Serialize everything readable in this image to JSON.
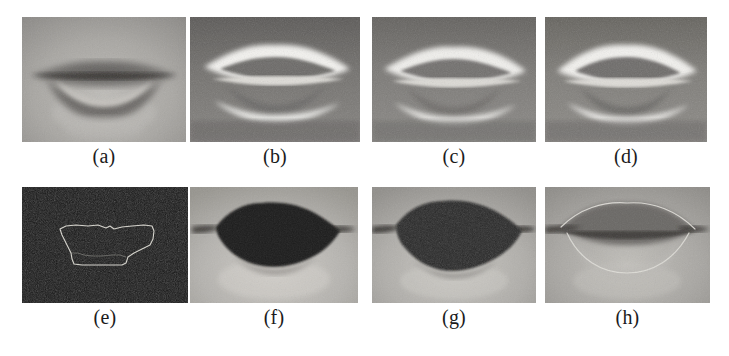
{
  "figure": {
    "layout": {
      "columns": 4,
      "rows": 2,
      "panel_width": 164,
      "panel_height": 125,
      "row1_top": 17,
      "row2_top": 187,
      "row2_panel_height": 116,
      "col_lefts": [
        22,
        190,
        372,
        545
      ],
      "label_row1_top": 145,
      "label_row2_top": 306
    },
    "background_color": "#ffffff",
    "label_color": "#1b1b1b",
    "panels": [
      {
        "id": "a",
        "label": "(a)",
        "caption_text": "(a)",
        "description": "original grayscale mouth image, closed lips, soft blurred contrast",
        "render": {
          "style": "photo",
          "skin_tone": "#a8a6a2",
          "lip_tone": "#5f5d5c",
          "inner_tone": "#cfcdc9",
          "noise": 0.1,
          "contrast": "low",
          "mouth_open": false,
          "edge_overlay": "none",
          "fill_mouth": false
        }
      },
      {
        "id": "b",
        "label": "(b)",
        "caption_text": "(b)",
        "description": "high-pass / gradient enhanced image, bright lip boundaries on dark background",
        "render": {
          "style": "edge-enhanced",
          "skin_tone": "#6f6d6b",
          "lip_tone": "#f2f1ee",
          "inner_tone": "#6a6866",
          "noise": 0.12,
          "contrast": "high",
          "mouth_open": false,
          "edge_overlay": "none",
          "fill_mouth": false
        }
      },
      {
        "id": "c",
        "label": "(c)",
        "caption_text": "(c)",
        "description": "enhanced image variant, bright outer lip ridges, darker inner region",
        "render": {
          "style": "edge-enhanced",
          "skin_tone": "#787674",
          "lip_tone": "#eeedea",
          "inner_tone": "#706e6c",
          "noise": 0.12,
          "contrast": "high",
          "mouth_open": false,
          "edge_overlay": "none",
          "fill_mouth": false
        }
      },
      {
        "id": "d",
        "label": "(d)",
        "caption_text": "(d)",
        "description": "enhanced image variant with sharper upper lip highlight",
        "render": {
          "style": "edge-enhanced",
          "skin_tone": "#7b7977",
          "lip_tone": "#f0efec",
          "inner_tone": "#6d6b69",
          "noise": 0.12,
          "contrast": "high",
          "mouth_open": false,
          "edge_overlay": "none",
          "fill_mouth": false
        }
      },
      {
        "id": "e",
        "label": "(e)",
        "caption_text": "(e)",
        "description": "binary / dark field image with thin light extracted contour of the mouth region",
        "render": {
          "style": "contour-on-dark",
          "skin_tone": "#181818",
          "lip_tone": "#181818",
          "inner_tone": "#181818",
          "noise": 0.25,
          "contrast": "dark",
          "mouth_open": false,
          "edge_overlay": "rough-contour",
          "contour_color": "#d8d6cf",
          "fill_mouth": false
        }
      },
      {
        "id": "f",
        "label": "(f)",
        "caption_text": "(f)",
        "description": "segmentation result: mouth region filled solid black over original face image",
        "render": {
          "style": "photo",
          "skin_tone": "#b5b3af",
          "lip_tone": "#1d1c1b",
          "inner_tone": "#1d1c1b",
          "noise": 0.09,
          "contrast": "medium",
          "mouth_open": false,
          "edge_overlay": "none",
          "fill_mouth": true
        }
      },
      {
        "id": "g",
        "label": "(g)",
        "caption_text": "(g)",
        "description": "segmentation result variant: filled black mouth with fine speckled texture",
        "render": {
          "style": "photo",
          "skin_tone": "#b0aeaa",
          "lip_tone": "#232221",
          "inner_tone": "#232221",
          "noise": 0.14,
          "contrast": "medium",
          "mouth_open": false,
          "edge_overlay": "none",
          "fill_mouth": true
        }
      },
      {
        "id": "h",
        "label": "(h)",
        "caption_text": "(h)",
        "description": "final extracted lip contour drawn as thin light curve over the original mouth image",
        "render": {
          "style": "photo",
          "skin_tone": "#a9a7a3",
          "lip_tone": "#6a6765",
          "inner_tone": "#b9b7b3",
          "noise": 0.1,
          "contrast": "low",
          "mouth_open": false,
          "edge_overlay": "smooth-contour",
          "contour_color": "#e2e0da",
          "fill_mouth": false
        }
      }
    ]
  }
}
